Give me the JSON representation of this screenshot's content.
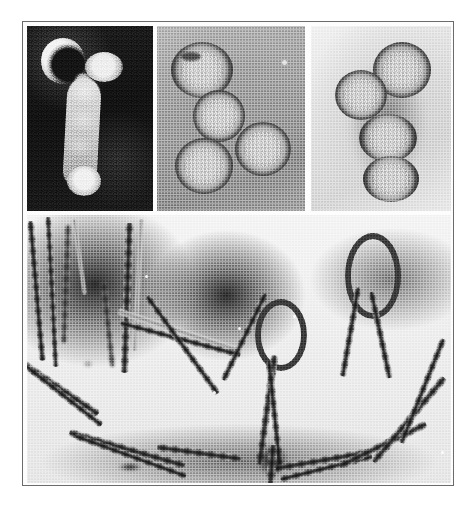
{
  "figure": {
    "kind": "transmission-electron-micrograph-composite",
    "caption": "",
    "background_color": "#ffffff",
    "frame": {
      "border_color": "#6b6b6b",
      "fill_color": "#fdfdfd"
    }
  },
  "panels": [
    {
      "id": "panel-a",
      "position": "top-left",
      "technique": "dark-field",
      "background_color": "#151515",
      "particle_color": "#e9e9e9",
      "particle_count": 4,
      "description": "Bright pleomorphic budding virion with crescent-shaped envelope, a round bleb, an elongated body and a terminal knob on a black background.",
      "features": [
        {
          "name": "crescent-envelope",
          "shape": "crescent"
        },
        {
          "name": "round-bleb",
          "shape": "sphere"
        },
        {
          "name": "elongated-body",
          "shape": "filament"
        },
        {
          "name": "terminal-knob",
          "shape": "sphere"
        }
      ]
    },
    {
      "id": "panel-b",
      "position": "top-center",
      "technique": "negative-stain",
      "background_color": "#a3a3a3",
      "particle_color": "#c6c6c6",
      "rim_color": "#2e2e2e",
      "particle_count": 4,
      "description": "Four roughly spherical, dark-rimmed virions with granular cores clustered on a mid-grey stain background.",
      "features": [
        {
          "name": "virion-1",
          "shape": "sphere"
        },
        {
          "name": "virion-2",
          "shape": "sphere"
        },
        {
          "name": "virion-3",
          "shape": "sphere"
        },
        {
          "name": "virion-4",
          "shape": "sphere"
        }
      ]
    },
    {
      "id": "panel-c",
      "position": "top-right",
      "technique": "negative-stain",
      "background_color": "#e4e4e4",
      "particle_color": "#d2d2d2",
      "rim_color": "#3c3c3c",
      "particle_count": 4,
      "description": "Four spherical to ovoid virions in a vertical cluster with fuzzy spiked envelopes on a pale background.",
      "features": [
        {
          "name": "virion-1",
          "shape": "sphere"
        },
        {
          "name": "virion-2",
          "shape": "sphere"
        },
        {
          "name": "virion-3",
          "shape": "ovoid"
        },
        {
          "name": "virion-4",
          "shape": "ovoid"
        }
      ]
    },
    {
      "id": "panel-d",
      "position": "bottom",
      "technique": "negative-stain",
      "background_color": "#eeeeee",
      "particle_color": "#2e2e2e",
      "description": "Long filamentous virions, several metres-long in scale terms, some straight, several folded into hairpin loops and twisted into rope-like braided pairs, over pools of dark stain.",
      "features": [
        {
          "name": "straight-filament-bundle-left",
          "shape": "filament"
        },
        {
          "name": "straight-filament-center",
          "shape": "filament"
        },
        {
          "name": "hairpin-loop-center",
          "shape": "loop"
        },
        {
          "name": "hairpin-loop-right",
          "shape": "loop"
        },
        {
          "name": "braided-rope-lower-left",
          "shape": "twisted-filament"
        },
        {
          "name": "braided-rope-lower-right",
          "shape": "twisted-filament"
        },
        {
          "name": "junction-node-bottom-center",
          "shape": "junction"
        }
      ]
    }
  ]
}
